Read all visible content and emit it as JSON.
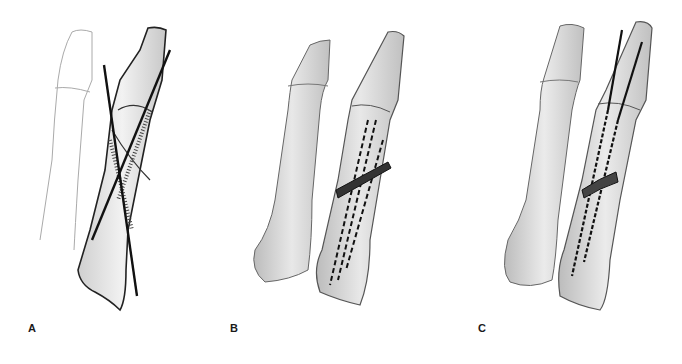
{
  "figure": {
    "panels": [
      {
        "id": "A",
        "label": "A",
        "description": "Crossed K-wires through fractured proximal phalanx, adjacent finger outline"
      },
      {
        "id": "B",
        "label": "B",
        "description": "Multiple dashed intramedullary wires with oblique fracture line"
      },
      {
        "id": "C",
        "label": "C",
        "description": "Two longitudinal wires entering from distal end, crossing fracture"
      }
    ],
    "colors": {
      "background": "#ffffff",
      "bone_fill": "#e6e6e6",
      "bone_shadow": "#bdbdbd",
      "outline": "#555555",
      "wire": "#111111",
      "label": "#1a1a1a"
    }
  }
}
